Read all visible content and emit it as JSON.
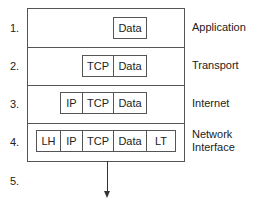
{
  "diagram": {
    "layers": [
      {
        "number": "1.",
        "label": "Application",
        "cells": [
          "Data"
        ]
      },
      {
        "number": "2.",
        "label": "Transport",
        "cells": [
          "TCP",
          "Data"
        ]
      },
      {
        "number": "3.",
        "label": "Internet",
        "cells": [
          "IP",
          "TCP",
          "Data"
        ]
      },
      {
        "number": "4.",
        "label_line1": "Network",
        "label_line2": "Interface",
        "cells": [
          "LH",
          "IP",
          "TCP",
          "Data",
          "LT"
        ]
      },
      {
        "number": "5."
      }
    ]
  }
}
